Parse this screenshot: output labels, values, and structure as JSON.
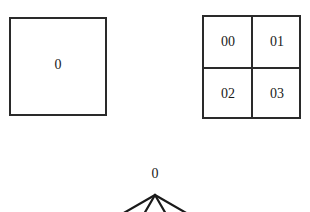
{
  "single_block": {
    "label": "0"
  },
  "quad_grid": {
    "cells": [
      "00",
      "01",
      "02",
      "03"
    ]
  },
  "tree": {
    "root_label": "0",
    "child_count": 4
  }
}
